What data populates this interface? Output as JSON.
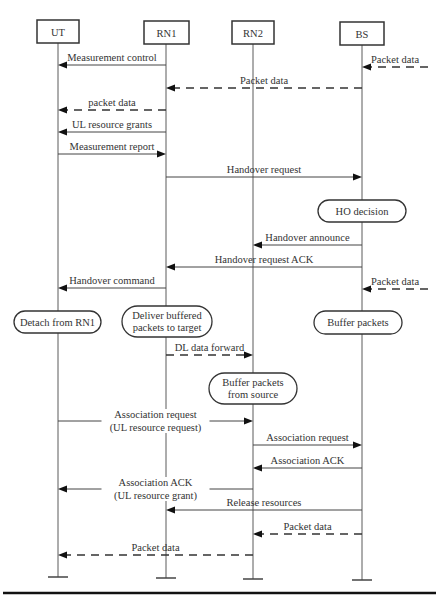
{
  "diagram": {
    "type": "sequence",
    "actors": [
      {
        "id": "UT",
        "label": "UT",
        "x": 58,
        "box": [
          37,
          20,
          42,
          23
        ],
        "end_y": 577
      },
      {
        "id": "RN1",
        "label": "RN1",
        "x": 166,
        "box": [
          144,
          21,
          45,
          23
        ],
        "end_y": 578
      },
      {
        "id": "RN2",
        "label": "RN2",
        "x": 253,
        "box": [
          232,
          21,
          42,
          23
        ],
        "end_y": 579
      },
      {
        "id": "BS",
        "label": "BS",
        "x": 362,
        "box": [
          340,
          22,
          44,
          23
        ],
        "end_y": 580
      }
    ],
    "messages": [
      {
        "label": "Packet data",
        "from": "EXT",
        "to": "BS",
        "y": 67,
        "style": "dashed",
        "from_x": 428
      },
      {
        "label": "Measurement control",
        "from": "RN1",
        "to": "UT",
        "y": 65,
        "style": "solid"
      },
      {
        "label": "Packet data",
        "from": "BS",
        "to": "RN1",
        "y": 88,
        "style": "dashed"
      },
      {
        "label": "packet data",
        "from": "RN1",
        "to": "UT",
        "y": 110,
        "style": "dashed"
      },
      {
        "label": "UL resource grants",
        "from": "RN1",
        "to": "UT",
        "y": 132,
        "style": "solid"
      },
      {
        "label": "Measurement report",
        "from": "UT",
        "to": "RN1",
        "y": 154,
        "style": "solid"
      },
      {
        "label": "Handover request",
        "from": "RN1",
        "to": "BS",
        "y": 177,
        "style": "solid"
      },
      {
        "label": "Handover announce",
        "from": "BS",
        "to": "RN2",
        "y": 245,
        "style": "solid"
      },
      {
        "label": "Handover request ACK",
        "from": "BS",
        "to": "RN1",
        "y": 267,
        "style": "solid"
      },
      {
        "label": "Handover command",
        "from": "RN1",
        "to": "UT",
        "y": 288,
        "style": "solid"
      },
      {
        "label": "Packet data",
        "from": "EXT",
        "to": "BS",
        "y": 289,
        "style": "dashed",
        "from_x": 428
      },
      {
        "label": "DL data forward",
        "from": "RN1",
        "to": "RN2",
        "y": 355,
        "style": "dashed"
      },
      {
        "label": "Association request",
        "label2": "(UL resource request)",
        "from": "UT",
        "to": "RN2",
        "y": 421,
        "style": "solid",
        "inline": true
      },
      {
        "label": "Association request",
        "from": "RN2",
        "to": "BS",
        "y": 445,
        "style": "solid"
      },
      {
        "label": "Association ACK",
        "from": "BS",
        "to": "RN2",
        "y": 468,
        "style": "solid"
      },
      {
        "label": "Association ACK",
        "label2": "(UL resource grant)",
        "from": "RN2",
        "to": "UT",
        "y": 489,
        "style": "solid",
        "inline": true
      },
      {
        "label": "Release resources",
        "from": "BS",
        "to": "RN1",
        "y": 510,
        "style": "solid"
      },
      {
        "label": "Packet data",
        "from": "BS",
        "to": "RN2",
        "y": 534,
        "style": "dashed"
      },
      {
        "label": "Packet data",
        "from": "RN2",
        "to": "UT",
        "y": 555,
        "style": "dashed"
      }
    ],
    "states": [
      {
        "label": "HO decision",
        "lines": [
          "HO decision"
        ],
        "box": [
          318,
          200,
          88,
          22
        ]
      },
      {
        "label": "Detach from RN1",
        "lines": [
          "Detach from RN1"
        ],
        "box": [
          14,
          311,
          87,
          22
        ]
      },
      {
        "label": "Deliver buffered packets to target",
        "lines": [
          "Deliver buffered",
          "packets to target"
        ],
        "box": [
          122,
          306,
          90,
          31
        ]
      },
      {
        "label": "Buffer packets",
        "lines": [
          "Buffer packets"
        ],
        "box": [
          314,
          311,
          88,
          23
        ]
      },
      {
        "label": "Buffer packets from source",
        "lines": [
          "Buffer packets",
          "from source"
        ],
        "box": [
          209,
          373,
          88,
          31
        ]
      }
    ],
    "bottom_rule": {
      "x1": 3,
      "x2": 436,
      "y": 593
    }
  }
}
